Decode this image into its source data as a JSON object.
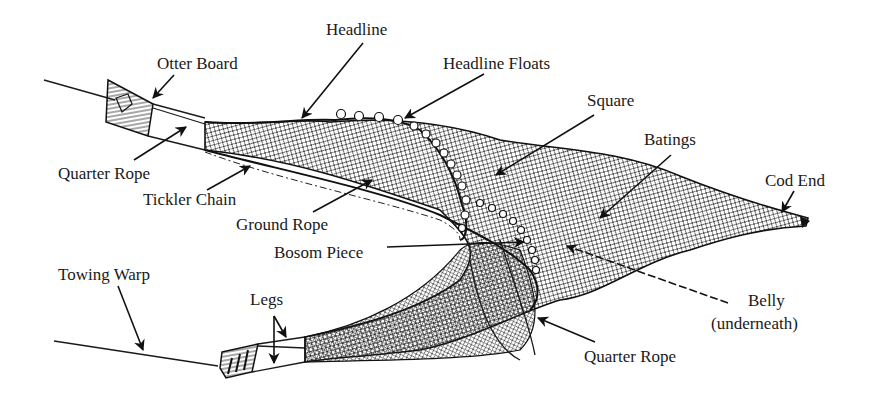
{
  "diagram": {
    "ink_color": "#1a1a1a",
    "background": "#ffffff",
    "labels": {
      "headline": "Headline",
      "otter_board": "Otter Board",
      "headline_floats": "Headline Floats",
      "square": "Square",
      "batings": "Batings",
      "cod_end": "Cod End",
      "quarter_rope_top": "Quarter Rope",
      "tickler_chain": "Tickler Chain",
      "ground_rope": "Ground Rope",
      "bosom_piece": "Bosom Piece",
      "towing_warp": "Towing Warp",
      "legs": "Legs",
      "belly": "Belly",
      "belly_note": "(underneath)",
      "quarter_rope_bottom": "Quarter Rope"
    }
  }
}
